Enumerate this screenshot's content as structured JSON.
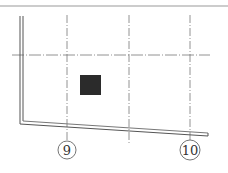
{
  "drawing": {
    "type": "structural-plan-fragment",
    "colors": {
      "background": "#ffffff",
      "line": "#555555",
      "axis_line": "#777777",
      "column_fill": "#2b2b2b",
      "top_border": "#999999"
    },
    "axes": [
      {
        "id": "axis-9",
        "label": "9",
        "x": 67
      },
      {
        "id": "axis-mid",
        "label": "",
        "x": 129
      },
      {
        "id": "axis-10",
        "label": "10",
        "x": 190
      }
    ],
    "horizontal_axis": {
      "y": 55,
      "x1": 12,
      "x2": 210
    },
    "column": {
      "x": 80,
      "y": 75,
      "width": 21,
      "height": 20
    },
    "axis_bubbles": [
      {
        "label": "9",
        "cx": 67,
        "cy": 150,
        "r": 9
      },
      {
        "label": "10",
        "cx": 190,
        "cy": 150,
        "r": 10
      }
    ]
  }
}
